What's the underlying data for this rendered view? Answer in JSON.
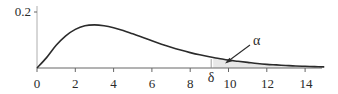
{
  "chart_data": {
    "type": "area",
    "title": "",
    "xlabel": "",
    "ylabel": "",
    "distribution_hint": "right-skewed density (chi-square-like, peak near x=3)",
    "x": [
      0,
      0.5,
      1,
      1.5,
      2,
      2.5,
      3,
      3.5,
      4,
      4.5,
      5,
      5.5,
      6,
      6.5,
      7,
      7.5,
      8,
      8.5,
      9,
      9.5,
      10,
      10.5,
      11,
      11.5,
      12,
      12.5,
      13,
      13.5,
      14,
      14.5,
      15
    ],
    "series": [
      {
        "name": "density",
        "values": [
          0,
          0.037,
          0.081,
          0.115,
          0.138,
          0.151,
          0.154,
          0.151,
          0.144,
          0.134,
          0.122,
          0.11,
          0.097,
          0.085,
          0.074,
          0.064,
          0.055,
          0.047,
          0.04,
          0.034,
          0.028,
          0.024,
          0.02,
          0.016,
          0.013,
          0.011,
          0.009,
          0.007,
          0.006,
          0.005,
          0.004
        ]
      }
    ],
    "xlim": [
      0,
      15
    ],
    "ylim": [
      0,
      0.2
    ],
    "x_ticks": [
      0,
      2,
      4,
      6,
      8,
      10,
      12,
      14
    ],
    "x_tick_labels": [
      "0",
      "2",
      "4",
      "6",
      "8",
      "10",
      "12",
      "14"
    ],
    "y_ticks": [
      0.2
    ],
    "y_tick_labels": [
      "0.2"
    ],
    "grid": false,
    "legend": null,
    "annotations": [
      {
        "label": "δ",
        "x": 9.2,
        "role": "critical value marker on x-axis"
      },
      {
        "label": "α",
        "role": "shaded right-tail area beyond δ, indicated by arrow"
      }
    ],
    "shaded_region": {
      "from": 9.2,
      "to": 15,
      "meaning": "α"
    }
  },
  "labels": {
    "y_tick_02": "0.2",
    "x0": "0",
    "x2": "2",
    "x4": "4",
    "x6": "6",
    "x8": "8",
    "x10": "10",
    "x12": "12",
    "x14": "14",
    "delta": "δ",
    "alpha": "α"
  },
  "colors": {
    "curve": "#2b2b2b",
    "axis": "#555555",
    "shade": "#e6e6e6"
  }
}
